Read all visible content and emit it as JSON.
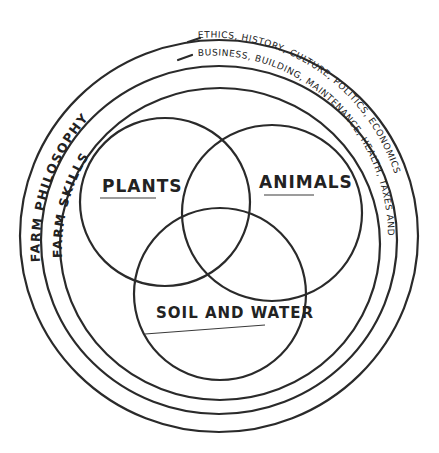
{
  "diagram": {
    "type": "nested-venn",
    "rings": [
      {
        "label": "FARM PHILOSOPHY",
        "description": "ETHICS, HISTORY, CULTURE, POLITICS, ECONOMICS"
      },
      {
        "label": "FARM SKILLS",
        "description": "BUSINESS, BUILDING, MAINTENANCE, HEALTH, TAXES AND LAW"
      }
    ],
    "circles": [
      {
        "label": "PLANTS"
      },
      {
        "label": "ANIMALS"
      },
      {
        "label": "SOIL AND WATER"
      }
    ],
    "stroke_color": "#2a2a2a",
    "background": "#ffffff"
  }
}
